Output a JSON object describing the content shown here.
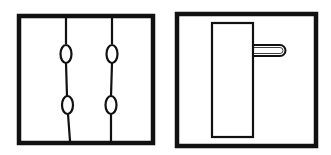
{
  "diagram": {
    "panels": [
      {
        "name": "left-panel",
        "description": "Square frame with two vertical lines, each with two knot/loop ovals",
        "frame": {
          "x": 19,
          "y": 16,
          "w": 134,
          "h": 127
        },
        "lines": [
          {
            "x_top": 66,
            "x_bottom": 70,
            "knots_y": [
              54,
              105
            ]
          },
          {
            "x_top": 112,
            "x_bottom": 111,
            "knots_y": [
              54,
              105
            ]
          }
        ]
      },
      {
        "name": "right-panel",
        "description": "Square frame with tall inner rectangle and a loop handle protruding right",
        "frame": {
          "x": 177,
          "y": 14,
          "w": 139,
          "h": 132
        },
        "inner_rect": {
          "x": 212,
          "y": 23,
          "w": 41,
          "h": 114
        },
        "handle": {
          "x1": 253,
          "x2": 286,
          "y_top": 45,
          "y_bottom": 56
        }
      }
    ],
    "colors": {
      "stroke": "#111111",
      "background": "#ffffff"
    }
  }
}
